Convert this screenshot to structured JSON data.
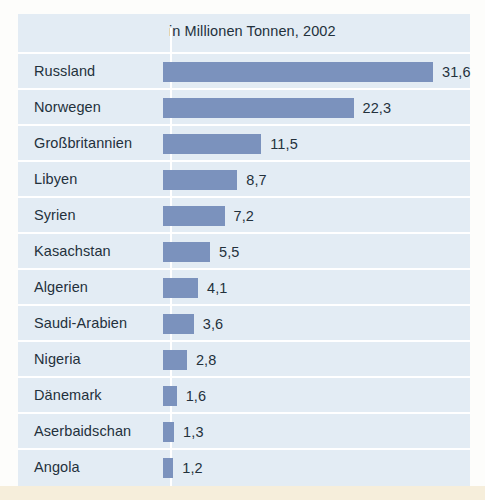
{
  "chart_data": {
    "type": "bar",
    "orientation": "horizontal",
    "title": "in Millionen Tonnen, 2002",
    "subtitle": "",
    "xlabel": "",
    "ylabel": "",
    "unit": "Millionen Tonnen",
    "year": "2002",
    "grid": false,
    "legend": "none",
    "xlim": [
      0,
      31.6
    ],
    "categories": [
      "Russland",
      "Norwegen",
      "Großbritannien",
      "Libyen",
      "Syrien",
      "Kasachstan",
      "Algerien",
      "Saudi-Arabien",
      "Nigeria",
      "Dänemark",
      "Aserbaidschan",
      "Angola"
    ],
    "values": [
      31.6,
      22.3,
      11.5,
      8.7,
      7.2,
      5.5,
      4.1,
      3.6,
      2.8,
      1.6,
      1.3,
      1.2
    ],
    "value_labels": [
      "31,6",
      "22,3",
      "11,5",
      "8,7",
      "7,2",
      "5,5",
      "4,1",
      "3,6",
      "2,8",
      "1,6",
      "1,3",
      "1,2"
    ],
    "bar_color": "#7b92bd",
    "panel_color": "#e3ecf4",
    "text_color": "#23313c",
    "rule_color": "#ffffff"
  },
  "rows": [
    {
      "label": "Russland",
      "value": "31,6",
      "v": 31.6
    },
    {
      "label": "Norwegen",
      "value": "22,3",
      "v": 22.3
    },
    {
      "label": "Großbritannien",
      "value": "11,5",
      "v": 11.5
    },
    {
      "label": "Libyen",
      "value": "8,7",
      "v": 8.7
    },
    {
      "label": "Syrien",
      "value": "7,2",
      "v": 7.2
    },
    {
      "label": "Kasachstan",
      "value": "5,5",
      "v": 5.5
    },
    {
      "label": "Algerien",
      "value": "4,1",
      "v": 4.1
    },
    {
      "label": "Saudi-Arabien",
      "value": "3,6",
      "v": 3.6
    },
    {
      "label": "Nigeria",
      "value": "2,8",
      "v": 2.8
    },
    {
      "label": "Dänemark",
      "value": "1,6",
      "v": 1.6
    },
    {
      "label": "Aserbaidschan",
      "value": "1,3",
      "v": 1.3
    },
    {
      "label": "Angola",
      "value": "1,2",
      "v": 1.2
    }
  ]
}
